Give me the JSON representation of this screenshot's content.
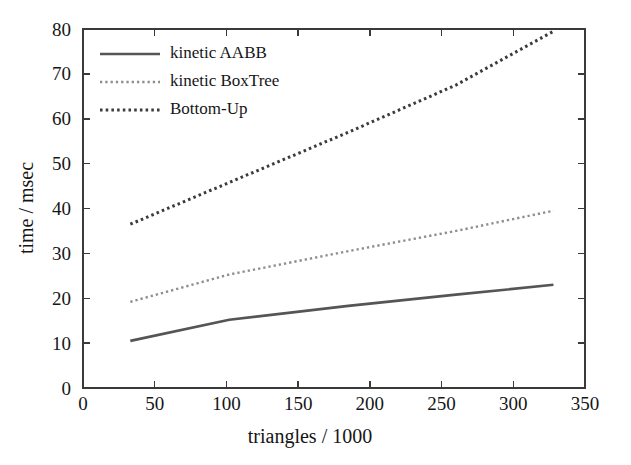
{
  "chart_data": {
    "type": "line",
    "title": "",
    "subtitle": "",
    "xlabel": "triangles / 1000",
    "ylabel": "time / msec",
    "xlim": [
      0,
      350
    ],
    "ylim": [
      0,
      80
    ],
    "xticks": [
      0,
      50,
      100,
      150,
      200,
      250,
      300,
      350
    ],
    "yticks": [
      0,
      10,
      20,
      30,
      40,
      50,
      60,
      70,
      80
    ],
    "xtick_labels": [
      "0",
      "50",
      "100",
      "150",
      "200",
      "250",
      "300",
      "350"
    ],
    "ytick_labels": [
      "0",
      "10",
      "20",
      "30",
      "40",
      "50",
      "60",
      "70",
      "80"
    ],
    "grid": false,
    "legend_position": "top-left-inside",
    "series": [
      {
        "name": "kinetic AABB",
        "style": "solid",
        "color": "#555555",
        "width": 2.6,
        "x": [
          33,
          102,
          185,
          260,
          328
        ],
        "values": [
          10.5,
          15.2,
          18.3,
          20.8,
          23.0
        ]
      },
      {
        "name": "kinetic BoxTree",
        "style": "fine-dotted",
        "color": "#8d8d8d",
        "width": 2.4,
        "x": [
          33,
          102,
          185,
          260,
          328
        ],
        "values": [
          19.2,
          25.3,
          30.5,
          35.0,
          39.5
        ]
      },
      {
        "name": "Bottom-Up",
        "style": "dotted",
        "color": "#3b3b3b",
        "width": 3.0,
        "x": [
          33,
          102,
          185,
          260,
          328
        ],
        "values": [
          36.5,
          45.8,
          57.0,
          67.5,
          79.5
        ]
      }
    ]
  },
  "legend": {
    "entries": [
      {
        "label": "kinetic AABB"
      },
      {
        "label": "kinetic BoxTree"
      },
      {
        "label": "Bottom-Up"
      }
    ]
  },
  "axes": {
    "x_title": "triangles / 1000",
    "y_title": "time / msec"
  }
}
